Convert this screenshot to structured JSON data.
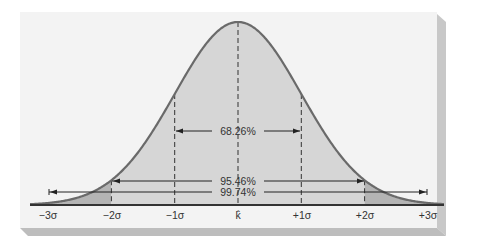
{
  "figure": {
    "colors": {
      "panel": "#f4f4f4",
      "shadow": "#c4c4c4",
      "inner_fill": "#d6d6d6",
      "tail_fill": "#b4b4b4",
      "curve": "#6a6a6a",
      "lines": "#2a2a2a",
      "text": "#333333"
    }
  },
  "chart_data": {
    "type": "area",
    "title": "",
    "xlabel": "",
    "ylabel": "",
    "x_tick_labels": [
      "−3σ",
      "−2σ",
      "−1σ",
      "k̂",
      "+1σ",
      "+2σ",
      "+3σ"
    ],
    "x_ticks_sigma": [
      -3,
      -2,
      -1,
      0,
      1,
      2,
      3
    ],
    "curve": "standard normal probability density",
    "shaded_regions": [
      {
        "range": [
          -2,
          2
        ],
        "shade": "light"
      },
      {
        "range": [
          -3,
          -2
        ],
        "shade": "dark"
      },
      {
        "range": [
          2,
          3
        ],
        "shade": "dark"
      }
    ],
    "annotations": [
      {
        "label": "68.26%",
        "range": [
          -1,
          1
        ]
      },
      {
        "label": "95.46%",
        "range": [
          -2,
          2
        ]
      },
      {
        "label": "99.74%",
        "range": [
          -3,
          3
        ]
      }
    ],
    "grid": false,
    "legend": "none"
  },
  "labels": {
    "ann_1": "68.26%",
    "ann_2": "95.46%",
    "ann_3": "99.74%",
    "ticks": [
      "−3σ",
      "−2σ",
      "−1σ",
      "k̂",
      "+1σ",
      "+2σ",
      "+3σ"
    ]
  }
}
